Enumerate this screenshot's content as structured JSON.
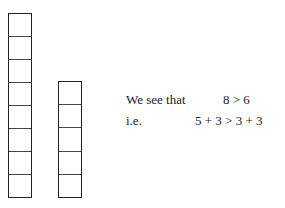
{
  "diagram": {
    "left_stack": {
      "cells": 8
    },
    "right_stack": {
      "cells": 5
    }
  },
  "text": {
    "line1_label": "We see that",
    "line1_expr": "8 > 6",
    "line2_label": "i.e.",
    "line2_expr": "5 + 3 > 3 + 3"
  }
}
